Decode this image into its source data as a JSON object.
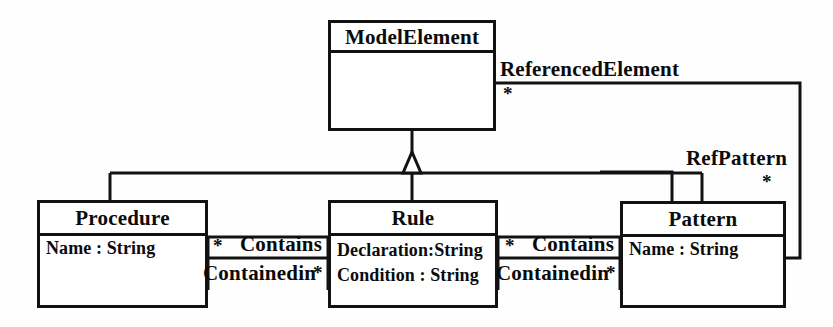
{
  "diagram": {
    "type": "uml-class-diagram",
    "background_color": "#fefefe",
    "line_color": "#121212",
    "text_color": "#0b0b0b"
  },
  "classes": [
    {
      "id": "modelelement",
      "name": "ModelElement",
      "attributes": []
    },
    {
      "id": "procedure",
      "name": "Procedure",
      "attributes": [
        "Name : String"
      ]
    },
    {
      "id": "rule",
      "name": "Rule",
      "attributes": [
        "Declaration:String",
        "Condition : String"
      ]
    },
    {
      "id": "pattern",
      "name": "Pattern",
      "attributes": [
        "Name : String"
      ]
    }
  ],
  "generalizations": [
    {
      "parent": "ModelElement",
      "child": "Procedure"
    },
    {
      "parent": "ModelElement",
      "child": "Rule"
    },
    {
      "parent": "ModelElement",
      "child": "Pattern"
    }
  ],
  "associations": [
    {
      "id": "referenced-element",
      "from": "ModelElement",
      "to": "Pattern",
      "label": "ReferencedElement",
      "multiplicity": "*"
    },
    {
      "id": "ref-pattern",
      "from": "ModelElement",
      "to": "Pattern",
      "label": "RefPattern",
      "multiplicity": "*"
    },
    {
      "id": "procedure-rule",
      "from": "Procedure",
      "to": "Rule",
      "forward_label": "Contains",
      "forward_multiplicity": "*",
      "reverse_label": "Containedin",
      "reverse_multiplicity": "*"
    },
    {
      "id": "rule-pattern",
      "from": "Rule",
      "to": "Pattern",
      "forward_label": "Contains",
      "forward_multiplicity": "*",
      "reverse_label": "Containedin",
      "reverse_multiplicity": "*"
    }
  ]
}
